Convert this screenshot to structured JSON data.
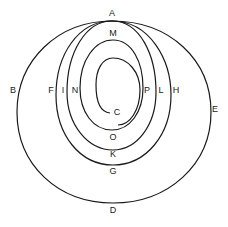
{
  "diagram": {
    "type": "spiral",
    "stroke_color": "#1a1a1a",
    "background": "#ffffff",
    "labels": {
      "A": "A",
      "B": "B",
      "C": "C",
      "D": "D",
      "E": "E",
      "F": "F",
      "G": "G",
      "H": "H",
      "I": "I",
      "K": "K",
      "L": "L",
      "M": "M",
      "N": "N",
      "O": "O",
      "P": "P"
    }
  }
}
